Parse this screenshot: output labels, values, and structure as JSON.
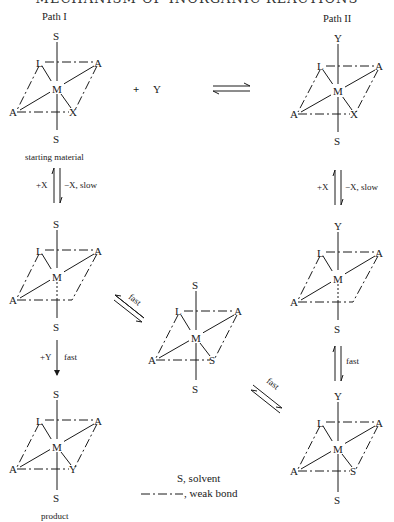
{
  "header": {
    "running_title": "MECHANISM OF INORGANIC REACTIONS"
  },
  "paths": {
    "left_title": "Path I",
    "right_title": "Path II"
  },
  "reagent": {
    "plus": "+",
    "species": "Y"
  },
  "structures": {
    "starting": {
      "top": "S",
      "ul": "L",
      "ur": "A",
      "center": "M",
      "ll": "A",
      "lr": "X",
      "bottom": "S",
      "caption": "starting material"
    },
    "path2_top": {
      "top": "Y",
      "ul": "L",
      "ur": "A",
      "center": "M",
      "ll": "A",
      "lr": "X",
      "bottom": "S"
    },
    "intermediate_left": {
      "top": "S",
      "ul": "L",
      "ur": "A",
      "center": "M",
      "ll": "A",
      "bottom": "S"
    },
    "central": {
      "top": "S",
      "ul": "L",
      "ur": "A",
      "center": "M",
      "ll": "A",
      "lr": "S",
      "bottom": "S"
    },
    "intermediate_right": {
      "top": "Y",
      "ul": "L",
      "ur": "A",
      "center": "M",
      "ll": "A",
      "bottom": "S"
    },
    "product": {
      "top": "S",
      "ul": "L",
      "ur": "A",
      "center": "M",
      "ll": "A",
      "lr": "Y",
      "bottom": "S",
      "caption": "product"
    },
    "path2_bottom": {
      "top": "Y",
      "ul": "L",
      "ur": "A",
      "center": "M",
      "ll": "A",
      "lr": "S",
      "bottom": "S"
    }
  },
  "arrows": {
    "left_step1": {
      "left": "+X",
      "right": "−X, slow"
    },
    "right_step1": {
      "left": "+X",
      "right": "−X, slow"
    },
    "left_step2": {
      "left": "+Y",
      "right": "fast"
    },
    "right_step2": {
      "right": "fast"
    },
    "diag_upper": {
      "label": "fast"
    },
    "diag_lower": {
      "label": "fast"
    }
  },
  "legend": {
    "solvent": "S, solvent",
    "weak_bond": ", weak bond"
  }
}
